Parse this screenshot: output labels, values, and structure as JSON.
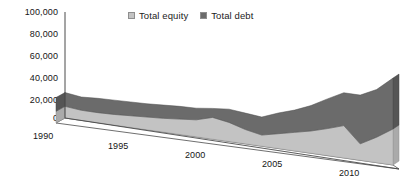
{
  "chart_data": {
    "type": "area",
    "stacked": true,
    "title": "",
    "subtitle": "",
    "xlabel": "",
    "ylabel": "",
    "x": [
      1990,
      1991,
      1992,
      1993,
      1994,
      1995,
      1996,
      1997,
      1998,
      1999,
      2000,
      2001,
      2002,
      2003,
      2004,
      2005,
      2006,
      2007,
      2008,
      2009,
      2010
    ],
    "categories": [
      "1990",
      "1991",
      "1992",
      "1993",
      "1994",
      "1995",
      "1996",
      "1997",
      "1998",
      "1999",
      "2000",
      "2001",
      "2002",
      "2003",
      "2004",
      "2005",
      "2006",
      "2007",
      "2008",
      "2009",
      "2010"
    ],
    "series": [
      {
        "name": "Total equity",
        "color": "#c3c3c3",
        "values": [
          11000,
          9500,
          9500,
          10000,
          11000,
          12000,
          13000,
          14500,
          16000,
          20500,
          18000,
          13500,
          10500,
          14000,
          17500,
          21000,
          25500,
          30500,
          15500,
          24000,
          34000
        ]
      },
      {
        "name": "Total debt",
        "color": "#6b6b6b",
        "values": [
          13000,
          12500,
          13500,
          13500,
          13000,
          12500,
          12500,
          12000,
          11000,
          8500,
          12500,
          15500,
          17000,
          19500,
          21000,
          24000,
          28000,
          31000,
          46000,
          45000,
          48000
        ]
      }
    ],
    "totals": [
      24000,
      22000,
      23000,
      23500,
      24000,
      24500,
      25500,
      26500,
      27000,
      29000,
      30500,
      29000,
      27500,
      33500,
      38500,
      45000,
      53500,
      61500,
      61500,
      69000,
      82000
    ],
    "ylim": [
      0,
      100000
    ],
    "ytick_labels": [
      "100,000",
      "80,000",
      "60,000",
      "40,000",
      "20,000",
      "0"
    ],
    "ytick_values": [
      100000,
      80000,
      60000,
      40000,
      20000,
      0
    ],
    "xtick_labels": [
      "1990",
      "1995",
      "2000",
      "2005",
      "2010"
    ],
    "xtick_values": [
      1990,
      1995,
      2000,
      2005,
      2010
    ],
    "grid": false,
    "legend_position": "top-center",
    "three_d": true
  },
  "legend": {
    "items": [
      {
        "label": "Total equity",
        "color": "#c3c3c3"
      },
      {
        "label": "Total debt",
        "color": "#6b6b6b"
      }
    ]
  },
  "axes": {
    "y_labels": [
      "100,000",
      "80,000",
      "60,000",
      "40,000",
      "20,000",
      "0"
    ],
    "x_labels": [
      "1990",
      "1995",
      "2000",
      "2005",
      "2010"
    ]
  },
  "colors": {
    "equity": "#c3c3c3",
    "debt": "#6b6b6b",
    "equity_side": "#aaaaaa",
    "debt_side": "#555555",
    "axis": "#4a4a4a",
    "floor": "#ffffff",
    "text": "#151515"
  }
}
